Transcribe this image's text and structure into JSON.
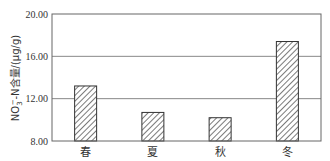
{
  "chart_data": {
    "type": "bar",
    "title": "",
    "xlabel": "",
    "ylabel": "NO3⁻-N含量/(μg/g)",
    "ylabel_parts": {
      "base": "NO",
      "sub": "3",
      "sup": "−",
      "rest": "-N含量/(μg/g)"
    },
    "categories": [
      "春",
      "夏",
      "秋",
      "冬"
    ],
    "values": [
      13.2,
      10.7,
      10.2,
      17.4
    ],
    "ylim": [
      8.0,
      20.0
    ],
    "yticks": [
      8.0,
      12.0,
      16.0,
      20.0
    ],
    "ytick_labels": [
      "8.00",
      "12.00",
      "16.00",
      "20.00"
    ],
    "grid": true,
    "legend": null,
    "bar_pattern": "diagonal-hatch",
    "colors": {
      "bar_fill": "#ffffff",
      "hatch": "#333333",
      "axis": "#555555",
      "grid": "#888888"
    }
  }
}
